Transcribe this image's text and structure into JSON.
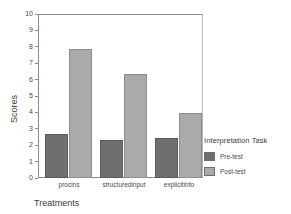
{
  "chart_data": {
    "type": "bar",
    "title": "",
    "subtitle": "",
    "xlabel": "Treatments",
    "ylabel": "Scores",
    "categories": [
      "procins",
      "structuredinput",
      "explicitinfo"
    ],
    "series": [
      {
        "name": "Pre-test",
        "values": [
          2.7,
          2.3,
          2.45
        ],
        "color": "#6f6f6f"
      },
      {
        "name": "Post-test",
        "values": [
          7.85,
          6.35,
          3.95
        ],
        "color": "#aaaaaa"
      }
    ],
    "ylim": [
      0,
      10
    ],
    "yticks": [
      10,
      9,
      8,
      7,
      6,
      5,
      4,
      3,
      2,
      1,
      0
    ],
    "grid": false,
    "legend": {
      "title": "Interpretation Task",
      "position": "right",
      "entries": [
        {
          "label": "Pre-test",
          "color": "#6f6f6f"
        },
        {
          "label": "Post-test",
          "color": "#aaaaaa"
        }
      ]
    }
  }
}
